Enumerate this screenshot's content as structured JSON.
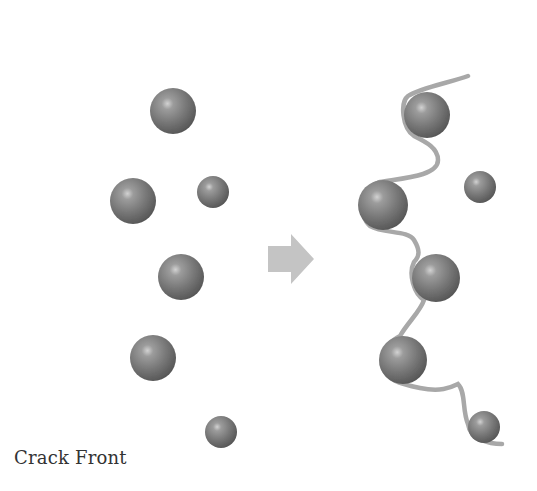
{
  "diagram": {
    "type": "schematic",
    "label": "Crack Front",
    "colors": {
      "particle": "#7a7a7a",
      "particle_highlight": "#c8c8c8",
      "particle_shadow": "#4e4e4e",
      "crack_front": "#9a9a9a",
      "arrow": "#c4c4c4",
      "text": "#333333"
    },
    "crack_front_left": {
      "x": 63,
      "y1": 32,
      "y2": 432,
      "width": 4
    },
    "arrow": {
      "x": 268,
      "y": 234,
      "width": 46,
      "height": 50
    },
    "particles_left": [
      {
        "cx": 173,
        "cy": 111,
        "r": 23
      },
      {
        "cx": 133,
        "cy": 201,
        "r": 23
      },
      {
        "cx": 213,
        "cy": 192,
        "r": 16
      },
      {
        "cx": 181,
        "cy": 277,
        "r": 23
      },
      {
        "cx": 153,
        "cy": 358,
        "r": 23
      },
      {
        "cx": 221,
        "cy": 432,
        "r": 16
      }
    ],
    "particles_right": [
      {
        "cx": 427,
        "cy": 115,
        "r": 23
      },
      {
        "cx": 383,
        "cy": 205,
        "r": 25
      },
      {
        "cx": 480,
        "cy": 187,
        "r": 16
      },
      {
        "cx": 436,
        "cy": 278,
        "r": 24
      },
      {
        "cx": 403,
        "cy": 360,
        "r": 24
      },
      {
        "cx": 484,
        "cy": 427,
        "r": 16
      }
    ]
  }
}
